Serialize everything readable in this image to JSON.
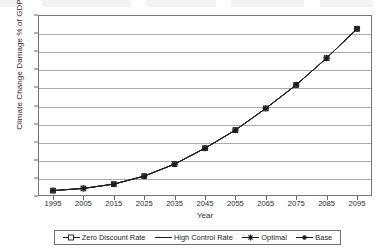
{
  "chart_data": {
    "type": "line",
    "title": "",
    "xlabel": "Year",
    "ylabel": "Climate Change Damage % of GDP",
    "grid": true,
    "legend_position": "bottom",
    "xlim": [
      1995,
      2095
    ],
    "ylim": [
      0,
      5.0
    ],
    "y_tick_labels": [
      "5.0",
      "4.5",
      "4.0",
      "3.5",
      "3.0",
      "2.5",
      "2.0",
      "1.5",
      "1.0",
      "0.5",
      "–"
    ],
    "y_tick_values": [
      5.0,
      4.5,
      4.0,
      3.5,
      3.0,
      2.5,
      2.0,
      1.5,
      1.0,
      0.5,
      0
    ],
    "categories": [
      1995,
      2005,
      2015,
      2025,
      2035,
      2045,
      2055,
      2065,
      2075,
      2085,
      2095
    ],
    "x_tick_labels": [
      "1995",
      "2005",
      "2015",
      "2025",
      "2035",
      "2045",
      "2055",
      "2065",
      "2075",
      "2085",
      "2095"
    ],
    "series": [
      {
        "name": "Zero Discount Rate",
        "marker": "square",
        "values": [
          0.15,
          0.21,
          0.33,
          0.55,
          0.88,
          1.32,
          1.82,
          2.42,
          3.07,
          3.81,
          4.62
        ]
      },
      {
        "name": "High Control Rate",
        "marker": "none",
        "values": [
          0.15,
          0.21,
          0.33,
          0.55,
          0.88,
          1.32,
          1.82,
          2.42,
          3.07,
          3.81,
          4.62
        ]
      },
      {
        "name": "Optimal",
        "marker": "asterisk",
        "values": [
          0.15,
          0.21,
          0.33,
          0.55,
          0.88,
          1.32,
          1.82,
          2.42,
          3.07,
          3.81,
          4.62
        ]
      },
      {
        "name": "Base",
        "marker": "circle",
        "values": [
          0.15,
          0.21,
          0.33,
          0.55,
          0.88,
          1.32,
          1.82,
          2.42,
          3.07,
          3.81,
          4.62
        ]
      }
    ],
    "line_color": "#1a1a1a",
    "grid_color": "#9a9a9a",
    "plot_border_color": "#777777"
  },
  "legend": {
    "entries": [
      {
        "label": "Zero Discount Rate",
        "marker": "square-line-marker"
      },
      {
        "label": "High Control Rate",
        "marker": "plain-line-marker"
      },
      {
        "label": "Optimal",
        "marker": "asterisk-line-marker"
      },
      {
        "label": "Base",
        "marker": "circle-line-marker"
      }
    ]
  }
}
